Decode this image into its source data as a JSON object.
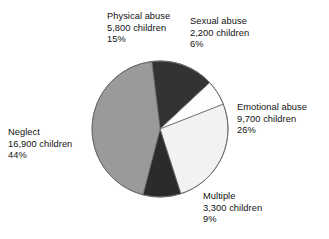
{
  "chart_data": {
    "type": "pie",
    "title": "",
    "subtitle": "",
    "xlabel": "",
    "ylabel": "",
    "legend_position": "none",
    "grid": false,
    "units": "children",
    "total_children": 37900,
    "categories": [
      "Physical abuse",
      "Sexual abuse",
      "Emotional abuse",
      "Multiple",
      "Neglect"
    ],
    "values": [
      5800,
      2200,
      9700,
      3300,
      16900
    ],
    "percentages": [
      15,
      6,
      26,
      9,
      44
    ],
    "slice_colors": [
      "#333333",
      "#fdfdfd",
      "#f2f2f2",
      "#2b2b2b",
      "#9a9a9a"
    ],
    "slices": [
      {
        "name": "Physical abuse",
        "count": 5800,
        "percent": 15,
        "count_text": "5,800 children",
        "percent_text": "15%",
        "color": "#333333",
        "start_angle": -7,
        "end_angle": 47
      },
      {
        "name": "Sexual abuse",
        "count": 2200,
        "percent": 6,
        "count_text": "2,200 children",
        "percent_text": "6%",
        "color": "#fdfdfd",
        "start_angle": 47,
        "end_angle": 68.6
      },
      {
        "name": "Emotional abuse",
        "count": 9700,
        "percent": 26,
        "count_text": "9,700 children",
        "percent_text": "26%",
        "color": "#f2f2f2",
        "start_angle": 68.6,
        "end_angle": 162.2
      },
      {
        "name": "Multiple",
        "count": 3300,
        "percent": 9,
        "count_text": "3,300 children",
        "percent_text": "9%",
        "color": "#2b2b2b",
        "start_angle": 162.2,
        "end_angle": 194.6
      },
      {
        "name": "Neglect",
        "count": 16900,
        "percent": 44,
        "count_text": "16,900 children",
        "percent_text": "44%",
        "color": "#9a9a9a",
        "start_angle": 194.6,
        "end_angle": 353
      }
    ],
    "geometry": {
      "center_x": 160,
      "center_y": 129,
      "radius": 68,
      "outline_color": "#6b6b6b"
    }
  },
  "labels": {
    "physical": {
      "name": "Physical abuse",
      "count": "5,800 children",
      "percent": "15%"
    },
    "sexual": {
      "name": "Sexual abuse",
      "count": "2,200 children",
      "percent": "6%"
    },
    "emotional": {
      "name": "Emotional abuse",
      "count": "9,700 children",
      "percent": "26%"
    },
    "neglect": {
      "name": "Neglect",
      "count": "16,900 children",
      "percent": "44%"
    },
    "multiple": {
      "name": "Multiple",
      "count": "3,300 children",
      "percent": "9%"
    }
  }
}
